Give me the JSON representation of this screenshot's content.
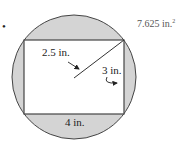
{
  "problem": {
    "bullet": "•",
    "answer": "7.625 in.",
    "answer_superscript": "2"
  },
  "figure": {
    "shape": "rectangle inscribed in circle",
    "shaded_region": "circle minus rectangle",
    "radius_label": "2.5 in.",
    "height_label": "3 in.",
    "width_label": "4 in.",
    "colors": {
      "shade": "#d4d4d4",
      "stroke": "#444444",
      "fill_rect": "#ffffff"
    }
  }
}
